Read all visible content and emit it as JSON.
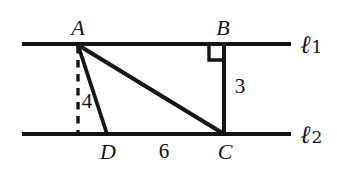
{
  "figure": {
    "type": "geometry-diagram",
    "background_color": "#ffffff",
    "stroke_color": "#151515",
    "lines": {
      "top": {
        "label_l": "ℓ",
        "label_sub": "1"
      },
      "bottom": {
        "label_l": "ℓ",
        "label_sub": "2"
      }
    },
    "points": {
      "a": "A",
      "b": "B",
      "c": "C",
      "d": "D"
    },
    "measures": {
      "ad": "4",
      "bc": "3",
      "dc": "6"
    },
    "markers": {
      "right_angle_at_b": "right-angle-square",
      "altitude": "dashed-vertical-from-A"
    }
  }
}
